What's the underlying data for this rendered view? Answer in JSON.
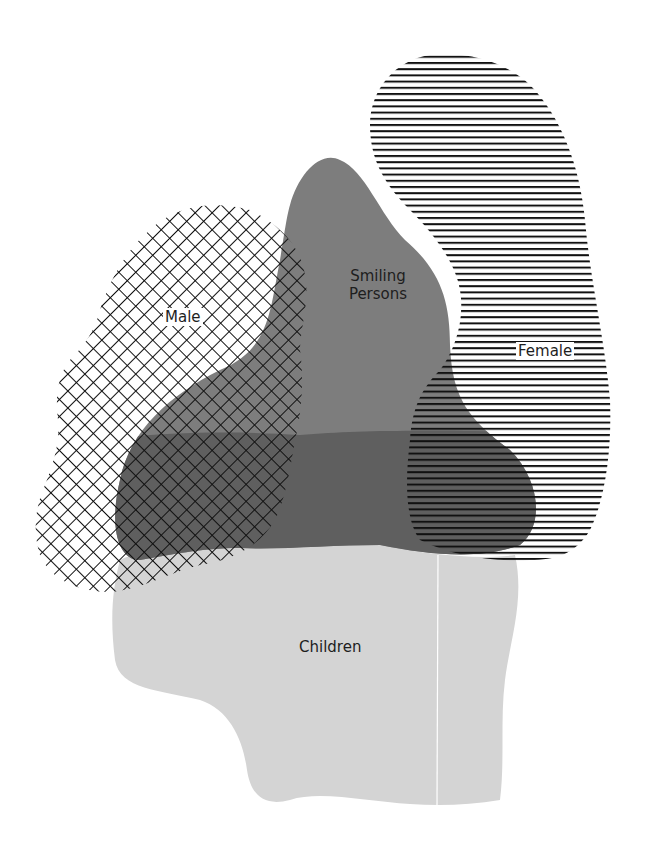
{
  "diagram": {
    "type": "overlapping-sets",
    "sets": [
      {
        "id": "male",
        "label": "Male",
        "fill": "crosshatch",
        "color": "#111111"
      },
      {
        "id": "smiling",
        "label_line1": "Smiling",
        "label_line2": "Persons",
        "fill": "solid",
        "color": "#7a7a7a"
      },
      {
        "id": "female",
        "label": "Female",
        "fill": "horizontal-lines",
        "color": "#111111"
      },
      {
        "id": "children",
        "label": "Children",
        "fill": "solid",
        "color": "#d4d4d4"
      }
    ],
    "overlap_color": "#5e5e5e"
  }
}
